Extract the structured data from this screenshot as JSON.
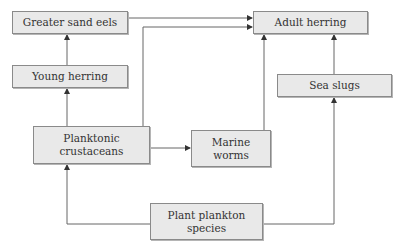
{
  "diagram": {
    "type": "food-web",
    "nodes": {
      "greater_sand_eels": {
        "label": "Greater sand eels"
      },
      "young_herring": {
        "label": "Young herring"
      },
      "planktonic_crustaceans": {
        "line1": "Planktonic",
        "line2": "crustaceans"
      },
      "marine_worms": {
        "line1": "Marine",
        "line2": "worms"
      },
      "plant_plankton": {
        "line1": "Plant plankton",
        "line2": "species"
      },
      "adult_herring": {
        "label": "Adult herring"
      },
      "sea_slugs": {
        "label": "Sea slugs"
      }
    },
    "edges": [
      {
        "from": "Greater sand eels",
        "to": "Adult herring"
      },
      {
        "from": "Planktonic crustaceans",
        "to": "Adult herring"
      },
      {
        "from": "Young herring",
        "to": "Greater sand eels"
      },
      {
        "from": "Planktonic crustaceans",
        "to": "Young herring"
      },
      {
        "from": "Planktonic crustaceans",
        "to": "Marine worms"
      },
      {
        "from": "Marine worms",
        "to": "Adult herring"
      },
      {
        "from": "Sea slugs",
        "to": "Adult herring"
      },
      {
        "from": "Plant plankton species",
        "to": "Sea slugs"
      },
      {
        "from": "Plant plankton species",
        "to": "Planktonic crustaceans"
      }
    ],
    "colors": {
      "box_fill": "#e9e9e9",
      "box_border": "#8a8a8a",
      "line": "#555555",
      "text": "#333333"
    }
  }
}
